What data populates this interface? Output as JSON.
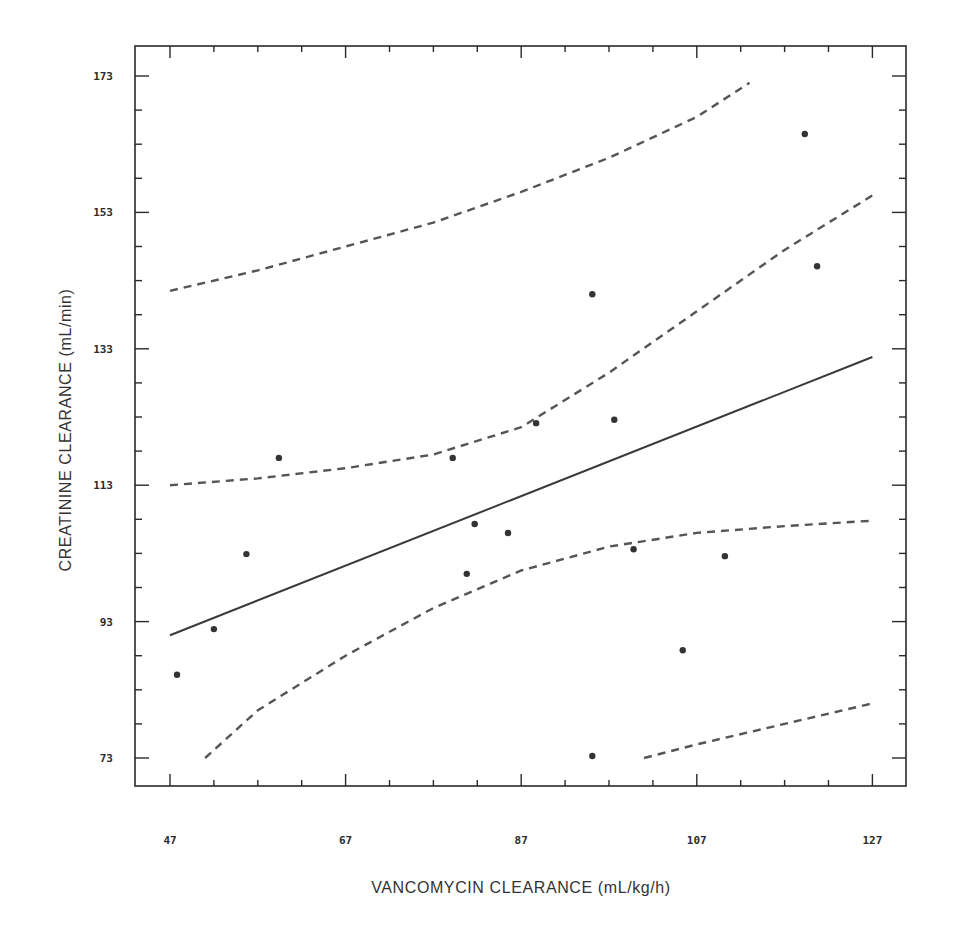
{
  "chart_data": {
    "type": "scatter",
    "title": "",
    "xlabel": "VANCOMYCIN CLEARANCE (mL/kg/h)",
    "ylabel": "CREATININE CLEARANCE (mL/min)",
    "xlim": [
      43,
      130
    ],
    "ylim": [
      68.5,
      176
    ],
    "x_ticks": [
      47,
      67,
      87,
      107,
      127
    ],
    "x_tick_labels": [
      "47",
      "67",
      "87",
      "107",
      "127"
    ],
    "y_ticks": [
      73,
      93,
      113,
      133,
      153,
      173
    ],
    "y_tick_labels": [
      "73",
      "93",
      "113",
      "133",
      "153",
      "173"
    ],
    "grid": false,
    "legend": null,
    "series": [
      {
        "name": "observations",
        "kind": "scatter",
        "points": [
          [
            47.8,
            85.2
          ],
          [
            52.0,
            91.9
          ],
          [
            55.7,
            102.9
          ],
          [
            59.4,
            117.0
          ],
          [
            79.2,
            117.0
          ],
          [
            80.8,
            100.0
          ],
          [
            81.7,
            107.3
          ],
          [
            85.5,
            106.0
          ],
          [
            88.7,
            122.1
          ],
          [
            95.1,
            141.0
          ],
          [
            95.1,
            73.3
          ],
          [
            97.6,
            122.6
          ],
          [
            99.8,
            103.6
          ],
          [
            105.4,
            88.8
          ],
          [
            110.2,
            102.6
          ],
          [
            119.3,
            164.5
          ],
          [
            120.7,
            145.1
          ]
        ]
      },
      {
        "name": "regression line",
        "kind": "line",
        "style": "solid",
        "points": [
          [
            47,
            91.0
          ],
          [
            127,
            131.8
          ]
        ]
      },
      {
        "name": "upper confidence band",
        "kind": "line",
        "style": "dashed",
        "points": [
          [
            47,
            113.0
          ],
          [
            57,
            114.0
          ],
          [
            67,
            115.5
          ],
          [
            77,
            117.5
          ],
          [
            87,
            121.5
          ],
          [
            97,
            129.5
          ],
          [
            107,
            138.5
          ],
          [
            117,
            147.5
          ],
          [
            127,
            155.5
          ]
        ]
      },
      {
        "name": "lower confidence band",
        "kind": "line",
        "style": "dashed",
        "points": [
          [
            51,
            73.0
          ],
          [
            57,
            80.0
          ],
          [
            67,
            88.0
          ],
          [
            77,
            95.0
          ],
          [
            87,
            100.5
          ],
          [
            97,
            104.0
          ],
          [
            107,
            106.0
          ],
          [
            117,
            107.0
          ],
          [
            127,
            107.8
          ]
        ]
      },
      {
        "name": "upper prediction band",
        "kind": "line",
        "style": "dashed",
        "points": [
          [
            47,
            141.5
          ],
          [
            57,
            144.5
          ],
          [
            67,
            148.0
          ],
          [
            77,
            151.5
          ],
          [
            87,
            156.0
          ],
          [
            97,
            161.0
          ],
          [
            107,
            167.0
          ],
          [
            113,
            172.0
          ]
        ]
      },
      {
        "name": "lower prediction band",
        "kind": "line",
        "style": "dashed",
        "points": [
          [
            101,
            73.0
          ],
          [
            107,
            75.0
          ],
          [
            117,
            78.0
          ],
          [
            127,
            81.0
          ]
        ]
      }
    ]
  },
  "axes": {
    "x_title": "VANCOMYCIN CLEARANCE (mL/kg/h)",
    "y_title": "CREATININE CLEARANCE (mL/min)"
  }
}
